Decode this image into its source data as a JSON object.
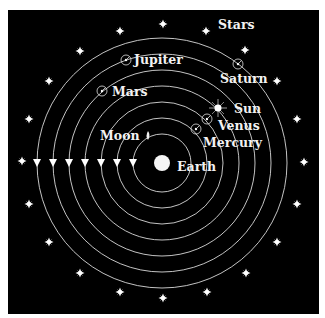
{
  "diagram": {
    "colors": {
      "background": "#000000",
      "frame": "#ffffff",
      "orbit": "#d9d9d9",
      "label": "#f2f2f2",
      "star": "#ffffff"
    },
    "center": {
      "name": "Earth",
      "x": 162,
      "y": 163
    },
    "labels": {
      "earth": "Earth",
      "moon": "Moon",
      "mercury": "Mercury",
      "venus": "Venus",
      "sun": "Sun",
      "mars": "Mars",
      "jupiter": "Jupiter",
      "saturn": "Saturn",
      "stars": "Stars"
    },
    "orbits": [
      {
        "body": "Moon",
        "radius": 29
      },
      {
        "body": "Mercury",
        "radius": 45
      },
      {
        "body": "Venus",
        "radius": 61
      },
      {
        "body": "Sun",
        "radius": 77
      },
      {
        "body": "Mars",
        "radius": 93
      },
      {
        "body": "Jupiter",
        "radius": 109
      },
      {
        "body": "Saturn",
        "radius": 125
      }
    ],
    "star_sphere_radius": 140,
    "star_count": 20,
    "direction_arrows": 7
  }
}
